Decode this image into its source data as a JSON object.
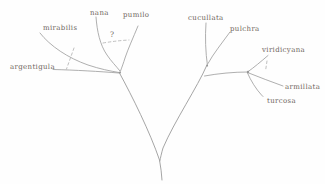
{
  "figure": {
    "background_color": "#fefefe",
    "branch_color": "#9b9b9b",
    "label_color": "#6e655c",
    "uncertainty_mark": "?",
    "taxa": [
      {
        "label": "argentigula"
      },
      {
        "label": "mirabilis"
      },
      {
        "label": "nana"
      },
      {
        "label": "pumilo"
      },
      {
        "label": "cucullata"
      },
      {
        "label": "pulchra"
      },
      {
        "label": "viridicyana"
      },
      {
        "label": "armillata"
      },
      {
        "label": "turcosa"
      }
    ],
    "topology": {
      "left_clade": [
        "argentigula",
        "mirabilis",
        "nana",
        "pumilo"
      ],
      "right_clade": [
        "cucullata",
        "pulchra",
        "viridicyana",
        "armillata",
        "turcosa"
      ],
      "dashed_links": [
        {
          "between": [
            "mirabilis",
            "argentigula"
          ],
          "annotation": ""
        },
        {
          "between": [
            "nana",
            "pumilo"
          ],
          "annotation": "?"
        },
        {
          "between": [
            "viridicyana",
            "armillata"
          ],
          "annotation": ""
        }
      ]
    }
  }
}
